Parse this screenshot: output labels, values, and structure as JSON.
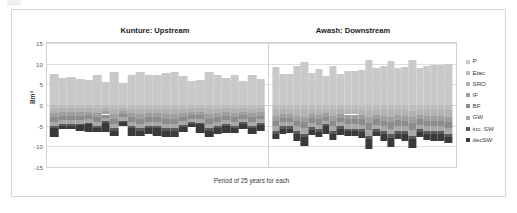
{
  "figure": {
    "y_axis_title": "Bm³",
    "x_axis_title": "Period of 25 years for each",
    "panel_titles": {
      "left": "Kunture: Upstream",
      "right": "Awash: Downstream"
    }
  },
  "legend": {
    "position": "right",
    "items": [
      {
        "label": "P",
        "color": "#c9c9c9"
      },
      {
        "label": "Etac",
        "color": "#bdbdbd"
      },
      {
        "label": "SRO",
        "color": "#b2b2b2"
      },
      {
        "label": "IF",
        "color": "#9f9f9f"
      },
      {
        "label": "BF",
        "color": "#8c8c8c"
      },
      {
        "label": "GW",
        "color": "#a8a8a8"
      },
      {
        "label": "inc. SW",
        "color": "#5a5a5a"
      },
      {
        "label": "decSW",
        "color": "#3a3a3a"
      }
    ]
  },
  "chart_data": {
    "type": "bar",
    "subtype": "stacked-bar-positive-negative",
    "title": "",
    "xlabel": "Period of 25 years for each",
    "ylabel": "Bm³",
    "ylim": [
      -15,
      15
    ],
    "yticks": [
      15,
      10,
      5,
      0,
      -5,
      -10,
      -15
    ],
    "grid": true,
    "legend_position": "right",
    "panels": [
      {
        "name": "Kunture: Upstream",
        "categories": [
          "1",
          "2",
          "3",
          "4",
          "5",
          "6",
          "7",
          "8",
          "9",
          "10",
          "11",
          "12",
          "13",
          "14",
          "15",
          "16",
          "17",
          "18",
          "19",
          "20",
          "21",
          "22",
          "23",
          "24",
          "25"
        ],
        "series": [
          {
            "name": "P",
            "values": [
              7.4,
              6.6,
              6.7,
              6.3,
              6.1,
              7.2,
              5.5,
              7.9,
              5.4,
              7.3,
              8.1,
              7.2,
              7.3,
              7.7,
              8.0,
              6.9,
              5.7,
              6.1,
              7.9,
              7.2,
              6.5,
              7.2,
              5.9,
              7.2,
              6.2
            ]
          },
          {
            "name": "Etac",
            "values": [
              -0.9,
              -0.8,
              -0.8,
              -0.8,
              -0.8,
              -0.9,
              -0.7,
              -1.0,
              -0.7,
              -0.9,
              -1.0,
              -0.9,
              -0.9,
              -1.0,
              -1.0,
              -0.9,
              -0.7,
              -0.8,
              -1.0,
              -0.9,
              -0.8,
              -0.9,
              -0.7,
              -0.9,
              -0.8
            ]
          },
          {
            "name": "SRO",
            "values": [
              -1.1,
              -1.0,
              -1.0,
              -0.9,
              -0.9,
              -1.1,
              -0.8,
              -1.2,
              -0.8,
              -1.1,
              -1.2,
              -1.1,
              -1.1,
              -1.2,
              -1.2,
              -1.0,
              -0.9,
              -0.9,
              -1.2,
              -1.1,
              -1.0,
              -1.1,
              -0.9,
              -1.1,
              -0.9
            ]
          },
          {
            "name": "IF",
            "values": [
              -1.0,
              -0.9,
              -0.9,
              -0.9,
              -0.8,
              -1.0,
              -0.8,
              -1.1,
              -0.7,
              -1.0,
              -1.1,
              -1.0,
              -1.0,
              -1.1,
              -1.1,
              -0.9,
              -0.8,
              -0.8,
              -1.1,
              -1.0,
              -0.9,
              -1.0,
              -0.8,
              -1.0,
              -0.9
            ]
          },
          {
            "name": "BF",
            "values": [
              -1.1,
              -1.0,
              -1.0,
              -1.0,
              -0.9,
              -1.1,
              -0.8,
              -1.2,
              -0.8,
              -1.1,
              -1.2,
              -1.1,
              -1.1,
              -1.2,
              -1.2,
              -1.0,
              -0.9,
              -0.9,
              -1.2,
              -1.1,
              -1.0,
              -1.1,
              -0.9,
              -1.1,
              -0.9
            ]
          },
          {
            "name": "GW",
            "values": [
              -1.0,
              -0.9,
              -0.9,
              -0.9,
              -0.9,
              -1.0,
              -0.8,
              -1.1,
              -0.8,
              -1.0,
              -1.1,
              -1.0,
              -1.0,
              -1.1,
              -1.1,
              -1.0,
              -0.8,
              -0.9,
              -1.1,
              -1.0,
              -0.9,
              -1.0,
              -0.9,
              -1.0,
              -0.9
            ]
          },
          {
            "name": "inc. SW",
            "values": [
              -0.5,
              -0.4,
              -0.4,
              -0.4,
              -0.4,
              -0.5,
              -0.4,
              -0.6,
              -0.4,
              -0.5,
              -0.6,
              -0.5,
              -0.5,
              -0.6,
              -0.6,
              -0.5,
              -0.4,
              -0.4,
              -0.6,
              -0.5,
              -0.4,
              -0.5,
              -0.4,
              -0.5,
              -0.4
            ]
          },
          {
            "name": "decSW",
            "values": [
              -2.1,
              -0.9,
              -0.9,
              -1.5,
              -1.9,
              -0.9,
              -2.2,
              -1.3,
              -1.0,
              -1.8,
              -1.3,
              -1.4,
              -1.8,
              -1.6,
              -1.6,
              -1.2,
              -0.9,
              -2.1,
              -1.6,
              -1.5,
              -1.7,
              -1.1,
              -1.3,
              -1.4,
              -1.4
            ]
          }
        ]
      },
      {
        "name": "Awash: Downstream",
        "categories": [
          "1",
          "2",
          "3",
          "4",
          "5",
          "6",
          "7",
          "8",
          "9",
          "10",
          "11",
          "12",
          "13",
          "14",
          "15",
          "16",
          "17",
          "18",
          "19",
          "20",
          "21",
          "22",
          "23",
          "24",
          "25"
        ],
        "series": [
          {
            "name": "P",
            "values": [
              9.3,
              7.6,
              7.5,
              9.5,
              10.4,
              7.8,
              8.6,
              7.0,
              9.5,
              7.6,
              8.3,
              8.3,
              8.5,
              10.9,
              8.9,
              9.5,
              10.6,
              9.0,
              9.2,
              10.8,
              8.9,
              9.5,
              9.6,
              9.6,
              10.0
            ]
          },
          {
            "name": "Etac",
            "values": [
              -1.2,
              -1.0,
              -1.0,
              -1.2,
              -1.3,
              -1.0,
              -1.1,
              -0.9,
              -1.2,
              -1.0,
              -1.1,
              -1.1,
              -1.1,
              -1.4,
              -1.1,
              -1.2,
              -1.3,
              -1.2,
              -1.2,
              -1.4,
              -1.1,
              -1.2,
              -1.2,
              -1.2,
              -1.3
            ]
          },
          {
            "name": "SRO",
            "values": [
              -1.4,
              -1.1,
              -1.1,
              -1.4,
              -1.5,
              -1.2,
              -1.3,
              -1.0,
              -1.4,
              -1.1,
              -1.2,
              -1.2,
              -1.3,
              -1.6,
              -1.3,
              -1.4,
              -1.6,
              -1.3,
              -1.4,
              -1.6,
              -1.3,
              -1.4,
              -1.4,
              -1.4,
              -1.5
            ]
          },
          {
            "name": "IF",
            "values": [
              -1.2,
              -1.0,
              -1.0,
              -1.2,
              -1.3,
              -1.0,
              -1.1,
              -0.9,
              -1.2,
              -1.0,
              -1.1,
              -1.1,
              -1.1,
              -1.4,
              -1.1,
              -1.2,
              -1.3,
              -1.2,
              -1.2,
              -1.4,
              -1.1,
              -1.2,
              -1.2,
              -1.2,
              -1.3
            ]
          },
          {
            "name": "BF",
            "values": [
              -1.4,
              -1.1,
              -1.1,
              -1.4,
              -1.5,
              -1.2,
              -1.3,
              -1.0,
              -1.4,
              -1.1,
              -1.2,
              -1.2,
              -1.3,
              -1.6,
              -1.3,
              -1.4,
              -1.6,
              -1.3,
              -1.4,
              -1.6,
              -1.3,
              -1.4,
              -1.4,
              -1.4,
              -1.5
            ]
          },
          {
            "name": "GW",
            "values": [
              -1.2,
              -1.0,
              -1.0,
              -1.2,
              -1.3,
              -1.0,
              -1.1,
              -0.9,
              -1.2,
              -1.0,
              -1.1,
              -1.1,
              -1.1,
              -1.4,
              -1.1,
              -1.2,
              -1.3,
              -1.2,
              -1.2,
              -1.4,
              -1.1,
              -1.2,
              -1.2,
              -1.2,
              -1.3
            ]
          },
          {
            "name": "inc. SW",
            "values": [
              -0.7,
              -0.6,
              -0.6,
              -0.7,
              -0.8,
              -0.6,
              -0.6,
              -0.5,
              -0.7,
              -0.6,
              -0.6,
              -0.6,
              -0.6,
              -0.8,
              -0.6,
              -0.7,
              -0.8,
              -0.7,
              -0.7,
              -0.8,
              -0.6,
              -0.7,
              -0.7,
              -0.7,
              -0.8
            ]
          },
          {
            "name": "decSW",
            "values": [
              -1.2,
              -1.1,
              -1.0,
              -1.5,
              -2.3,
              -1.2,
              -1.2,
              -1.9,
              -1.4,
              -1.5,
              -1.3,
              -1.3,
              -1.4,
              -2.4,
              -1.0,
              -1.5,
              -2.2,
              -1.4,
              -1.5,
              -2.2,
              -1.2,
              -1.4,
              -1.5,
              -1.5,
              -1.6
            ]
          }
        ]
      }
    ]
  }
}
